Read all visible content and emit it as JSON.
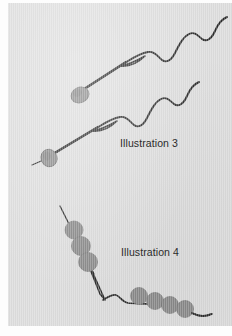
{
  "figure": {
    "background_color": "#dcdcdc",
    "page_color": "#fdfdfd",
    "ink_color": "#2b2b2b",
    "cell_fill_color": "#8a8a8a",
    "captions": [
      {
        "id": "illustration-3",
        "text": "Illustration 3"
      },
      {
        "id": "illustration-4",
        "text": "Illustration 4"
      }
    ],
    "illustration_3": {
      "label": "Illustration 3",
      "subject_count": 2,
      "subjects": [
        {
          "name": "spermatozoon-upper",
          "head_shape": "oval",
          "head_center": [
            72,
            92
          ],
          "head_rx": 9,
          "head_ry": 7.5,
          "has_midpiece_droplet": true,
          "tail_shape": "wavy"
        },
        {
          "name": "spermatozoon-lower",
          "head_shape": "oval",
          "head_center": [
            41,
            155
          ],
          "head_rx": 8,
          "head_ry": 8.5,
          "has_midpiece_droplet": true,
          "tail_shape": "wavy"
        }
      ]
    },
    "illustration_4": {
      "label": "Illustration 4",
      "subject_count": 1,
      "bead_fill_color": "#8a8a8a",
      "bead_groups": [
        {
          "name": "upper-bead-chain",
          "count": 3,
          "beads": [
            {
              "cx": 66,
              "cy": 227,
              "r": 9
            },
            {
              "cx": 73,
              "cy": 243,
              "r": 9.5
            },
            {
              "cx": 80,
              "cy": 259,
              "r": 9.5
            }
          ]
        },
        {
          "name": "lower-bead-chain",
          "count": 4,
          "beads": [
            {
              "cx": 131,
              "cy": 293,
              "r": 8.5
            },
            {
              "cx": 147,
              "cy": 298,
              "r": 8.5
            },
            {
              "cx": 162,
              "cy": 302,
              "r": 8.5
            },
            {
              "cx": 177,
              "cy": 306,
              "r": 8.5
            }
          ]
        }
      ],
      "filament_shape": "kinked-descending-curve"
    }
  }
}
